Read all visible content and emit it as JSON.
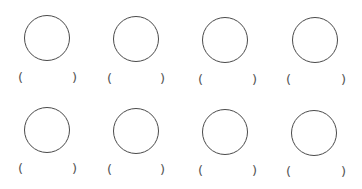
{
  "worksheet": {
    "items": [
      {
        "row": 1,
        "col": 1,
        "shape": "circle",
        "open_paren": "(",
        "close_paren": ")",
        "answer": ""
      },
      {
        "row": 1,
        "col": 2,
        "shape": "circle",
        "open_paren": "(",
        "close_paren": ")",
        "answer": ""
      },
      {
        "row": 1,
        "col": 3,
        "shape": "circle",
        "open_paren": "(",
        "close_paren": ")",
        "answer": ""
      },
      {
        "row": 1,
        "col": 4,
        "shape": "circle",
        "open_paren": "(",
        "close_paren": ")",
        "answer": ""
      },
      {
        "row": 2,
        "col": 1,
        "shape": "circle",
        "open_paren": "(",
        "close_paren": ")",
        "answer": ""
      },
      {
        "row": 2,
        "col": 2,
        "shape": "circle",
        "open_paren": "(",
        "close_paren": ")",
        "answer": ""
      },
      {
        "row": 2,
        "col": 3,
        "shape": "circle",
        "open_paren": "(",
        "close_paren": ")",
        "answer": ""
      },
      {
        "row": 2,
        "col": 4,
        "shape": "circle",
        "open_paren": "(",
        "close_paren": ")",
        "answer": ""
      }
    ],
    "colors": {
      "stroke": "#4a4a4a",
      "paren": "#555555",
      "background": "#ffffff"
    }
  }
}
